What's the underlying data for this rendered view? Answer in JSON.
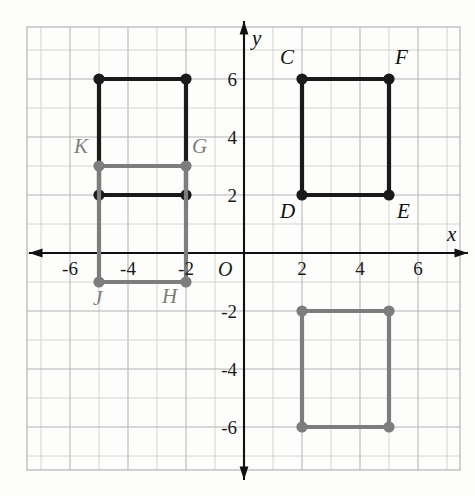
{
  "figure": {
    "kind": "coordinate-grid-diagram",
    "background_color": "#fdfdfc",
    "grid": {
      "minor_color": "#c9c9c9",
      "major_color": "#b4b4b4",
      "show": true,
      "cell_step": 1,
      "x_min": -7.5,
      "x_max": 7.5,
      "y_min": -7.8,
      "y_max": 7.8,
      "px_per_unit": 29,
      "origin_px": {
        "x": 244,
        "y": 253
      },
      "frame_px": {
        "left": 27,
        "top": 27,
        "right": 460,
        "bottom": 470
      }
    },
    "axes": {
      "color": "#111111",
      "x_axis_label": "x",
      "y_axis_label": "y",
      "origin_label": "O",
      "x_ticks": [
        "-6",
        "-4",
        "-2",
        "2",
        "4",
        "6"
      ],
      "x_tick_values": [
        -6,
        -4,
        -2,
        2,
        4,
        6
      ],
      "y_ticks": [
        "6",
        "4",
        "2",
        "-2",
        "-4",
        "-6"
      ],
      "y_tick_values": [
        6,
        4,
        2,
        -2,
        -4,
        -6
      ],
      "arrows": [
        "left",
        "right",
        "up",
        "down"
      ]
    },
    "colors": {
      "dark": "#1a1a1a",
      "gray": "#7d7d7d"
    },
    "shapes": [
      {
        "name": "black-rectangle-left",
        "color_key": "dark",
        "stroke_px": 4.2,
        "vertex_radius_px": 5.6,
        "closed": true,
        "points": [
          [
            -5,
            6
          ],
          [
            -2,
            6
          ],
          [
            -2,
            2
          ],
          [
            -5,
            2
          ]
        ]
      },
      {
        "name": "gray-rectangle-left-JHGK",
        "color_key": "gray",
        "stroke_px": 4.2,
        "vertex_radius_px": 5.6,
        "closed": true,
        "points": [
          [
            -5,
            3
          ],
          [
            -2,
            3
          ],
          [
            -2,
            -1
          ],
          [
            -5,
            -1
          ]
        ]
      },
      {
        "name": "black-rectangle-right-CDEF",
        "color_key": "dark",
        "stroke_px": 4.2,
        "vertex_radius_px": 5.6,
        "closed": true,
        "points": [
          [
            2,
            6
          ],
          [
            5,
            6
          ],
          [
            5,
            2
          ],
          [
            2,
            2
          ]
        ]
      },
      {
        "name": "gray-rectangle-bottom-right",
        "color_key": "gray",
        "stroke_px": 4.2,
        "vertex_radius_px": 5.6,
        "closed": true,
        "points": [
          [
            2,
            -2
          ],
          [
            5,
            -2
          ],
          [
            5,
            -6
          ],
          [
            2,
            -6
          ]
        ]
      }
    ],
    "point_labels": [
      {
        "id": "C",
        "text": "C",
        "color_key": "dark",
        "at": [
          2,
          6
        ],
        "offset_px": [
          -22,
          -32
        ]
      },
      {
        "id": "F",
        "text": "F",
        "color_key": "dark",
        "at": [
          5,
          6
        ],
        "offset_px": [
          6,
          -32
        ]
      },
      {
        "id": "D",
        "text": "D",
        "color_key": "dark",
        "at": [
          2,
          2
        ],
        "offset_px": [
          -22,
          6
        ]
      },
      {
        "id": "E",
        "text": "E",
        "color_key": "dark",
        "at": [
          5,
          2
        ],
        "offset_px": [
          8,
          6
        ]
      },
      {
        "id": "K",
        "text": "K",
        "color_key": "gray",
        "at": [
          -5,
          3
        ],
        "offset_px": [
          -25,
          -30
        ]
      },
      {
        "id": "G",
        "text": "G",
        "color_key": "gray",
        "at": [
          -2,
          3
        ],
        "offset_px": [
          6,
          -30
        ]
      },
      {
        "id": "J",
        "text": "J",
        "color_key": "gray",
        "at": [
          -5,
          -1
        ],
        "offset_px": [
          -6,
          6
        ]
      },
      {
        "id": "H",
        "text": "H",
        "color_key": "gray",
        "at": [
          -2,
          -1
        ],
        "offset_px": [
          -24,
          4
        ]
      }
    ]
  }
}
